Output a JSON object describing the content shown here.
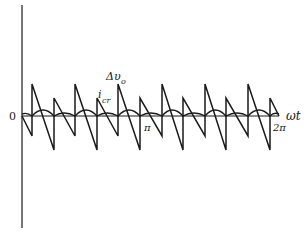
{
  "figure": {
    "type": "waveform-diagram",
    "axes": {
      "origin_label": "0",
      "x_axis_label": "ωt",
      "x_ticks": [
        {
          "label": "π",
          "position": "midpoint"
        },
        {
          "label": "2π",
          "position": "end"
        }
      ]
    },
    "curves": [
      {
        "name": "Δv_o",
        "label_main": "Δυ",
        "label_sub": "o",
        "shape": "sawtooth",
        "description": "Alternating tall and short sawtooth teeth; tall teeth drop to deep troughs, short teeth drop to medium troughs",
        "teeth_count": 12
      },
      {
        "name": "i_cr",
        "label_main": "i",
        "label_sub": "cr",
        "shape": "rectified ripple",
        "description": "Small rectified-sine ripple riding just above the axis, alternating larger and smaller bumps"
      }
    ],
    "colors": {
      "line": "#1a1a1a",
      "background": "#ffffff"
    }
  }
}
